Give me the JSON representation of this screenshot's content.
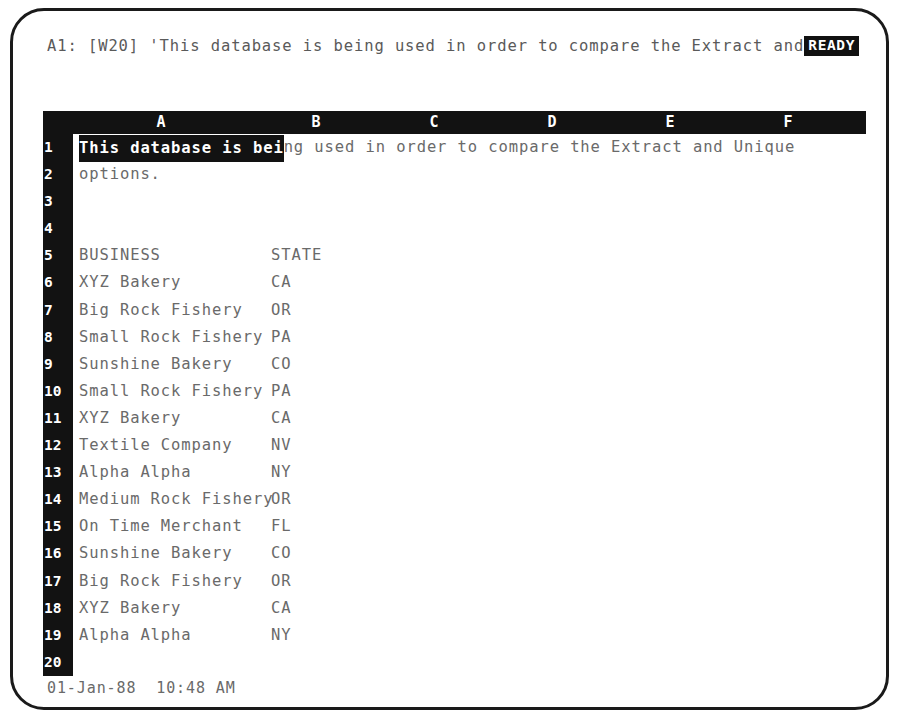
{
  "app": {
    "name": "Lotus 1-2-3"
  },
  "control_line": {
    "text": "A1: [W20] 'This database is being used in order to compare the Extract and",
    "mode_indicator": "READY"
  },
  "worksheet": {
    "column_headers": [
      "A",
      "B",
      "C",
      "D",
      "E",
      "F"
    ],
    "row_numbers": [
      "1",
      "2",
      "3",
      "4",
      "5",
      "6",
      "7",
      "8",
      "9",
      "10",
      "11",
      "12",
      "13",
      "14",
      "15",
      "16",
      "17",
      "18",
      "19",
      "20"
    ],
    "cursor": {
      "cell": "A1",
      "highlight_text": "This database is bei"
    },
    "rows": [
      {
        "number": "1",
        "a": "This database is being used in order to compare the Extract and Unique",
        "b": ""
      },
      {
        "number": "2",
        "a": "options.",
        "b": ""
      },
      {
        "number": "3",
        "a": "",
        "b": ""
      },
      {
        "number": "4",
        "a": "",
        "b": ""
      },
      {
        "number": "5",
        "a": "BUSINESS",
        "b": "STATE"
      },
      {
        "number": "6",
        "a": "XYZ Bakery",
        "b": "CA"
      },
      {
        "number": "7",
        "a": "Big Rock Fishery",
        "b": "OR"
      },
      {
        "number": "8",
        "a": "Small Rock Fishery",
        "b": "PA"
      },
      {
        "number": "9",
        "a": "Sunshine Bakery",
        "b": "CO"
      },
      {
        "number": "10",
        "a": "Small Rock Fishery",
        "b": "PA"
      },
      {
        "number": "11",
        "a": "XYZ Bakery",
        "b": "CA"
      },
      {
        "number": "12",
        "a": "Textile Company",
        "b": "NV"
      },
      {
        "number": "13",
        "a": "Alpha Alpha",
        "b": "NY"
      },
      {
        "number": "14",
        "a": "Medium Rock Fishery",
        "b": "OR"
      },
      {
        "number": "15",
        "a": "On Time Merchant",
        "b": "FL"
      },
      {
        "number": "16",
        "a": "Sunshine Bakery",
        "b": "CO"
      },
      {
        "number": "17",
        "a": "Big Rock Fishery",
        "b": "OR"
      },
      {
        "number": "18",
        "a": "XYZ Bakery",
        "b": "CA"
      },
      {
        "number": "19",
        "a": "Alpha Alpha",
        "b": "NY"
      },
      {
        "number": "20",
        "a": "",
        "b": ""
      }
    ]
  },
  "status_line": {
    "date": "01-Jan-88",
    "time": "10:48 AM",
    "text": "01-Jan-88  10:48 AM"
  },
  "colors": {
    "screen_background": "#ffffff",
    "header_background": "#121212",
    "header_text": "#ffffff",
    "cell_text": "#6a6a6a",
    "bezel": "#1a1a1a"
  }
}
